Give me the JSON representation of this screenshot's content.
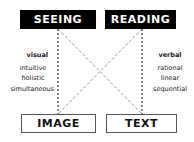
{
  "diagram": {
    "top_boxes": [
      {
        "label": "SEEING"
      },
      {
        "label": "READING"
      }
    ],
    "bottom_boxes": [
      {
        "label": "IMAGE"
      },
      {
        "label": "TEXT"
      }
    ],
    "left_column": {
      "heading": "visual",
      "items": [
        "intuitive",
        "holistic",
        "simultaneous"
      ]
    },
    "right_column": {
      "heading": "verbal",
      "items": [
        "rational",
        "linear",
        "sequential"
      ]
    },
    "colors": {
      "box_fill": "#000000",
      "vertical_line": "#333333",
      "cross_line": "#999999"
    }
  }
}
